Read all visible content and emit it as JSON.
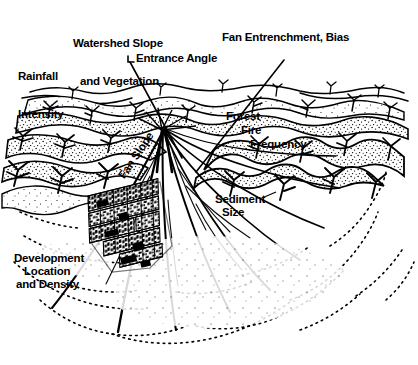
{
  "figure": {
    "kind": "alluvial-fan-hazard-diagram",
    "background_color": "#ffffff",
    "ink_color": "#000000",
    "width": 418,
    "height": 365
  },
  "labels": {
    "rainfall_intensity_line1": "Rainfall",
    "rainfall_intensity_line2": "Intensity",
    "watershed_line1": "Watershed Slope",
    "watershed_line2": "and Vegetation",
    "entrance_angle": "Entrance Angle",
    "fan_entrenchment": "Fan Entrenchment, Bias",
    "forest": "Forest",
    "fire": "Fire",
    "frequency": "Frequency",
    "sediment": "Sediment",
    "size": "Size",
    "fan_slope": "Fan Slope",
    "development_line1": "Development",
    "development_line2": "Location",
    "development_line3": "and Density"
  },
  "leader_lines": [
    {
      "name": "entrance-angle-leader",
      "from": [
        133,
        62
      ],
      "to": [
        181,
        158
      ]
    },
    {
      "name": "fan-entrenchment-leader",
      "from": [
        283,
        61
      ],
      "to": [
        196,
        172
      ]
    }
  ],
  "features": {
    "fan_apex": [
      162,
      130
    ],
    "mountain_front": "ridge-and-valley skyline with stippled chaparral vegetation",
    "fan_surface": "radiating distributary channels fanning downslope",
    "urban_grid": "dense street-block development on the mid fan",
    "distal_deposits": "stippled and dotted distal fan / playa margin"
  }
}
